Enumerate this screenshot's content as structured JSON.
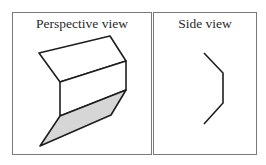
{
  "panels": [
    {
      "title": "Perspective view",
      "frame": {
        "x": 12,
        "y": 12,
        "w": 140,
        "h": 143
      }
    },
    {
      "title": "Side view",
      "frame": {
        "x": 153,
        "y": 12,
        "w": 104,
        "h": 143
      }
    }
  ],
  "colors": {
    "stroke": "#1e1e1e",
    "shaded_face": "#d6d6d6",
    "frame_border": "#7a7a7a"
  }
}
